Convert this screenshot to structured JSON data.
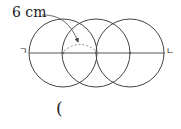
{
  "diagram": {
    "length_label": "6 cm",
    "left_endpoint_label": "ㄱ",
    "right_endpoint_label": "ㄴ",
    "answer_paren": "(",
    "circles": [
      {
        "cx": 63,
        "cy": 53,
        "r": 34
      },
      {
        "cx": 96,
        "cy": 53,
        "r": 34
      },
      {
        "cx": 130,
        "cy": 53,
        "r": 34
      }
    ],
    "line": {
      "x1": 29,
      "y1": 53,
      "x2": 165,
      "y2": 53
    },
    "center_points": [
      63,
      96,
      130
    ],
    "colors": {
      "stroke": "#444444",
      "dashed": "#8a8a8a",
      "point": "#666666"
    }
  }
}
